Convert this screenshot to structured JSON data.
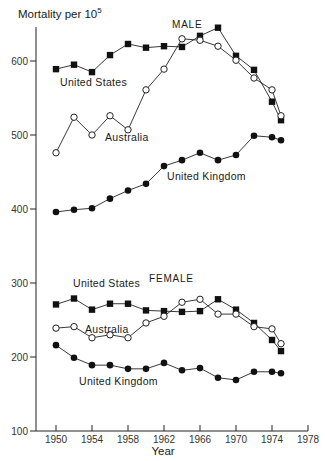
{
  "chart_data": {
    "type": "line",
    "title": "",
    "ylabel": "Mortality per 10^5",
    "ylabel_base": "Mortality per 10",
    "ylabel_exp": "5",
    "xlabel": "Year",
    "xlim": [
      1948,
      1978
    ],
    "ylim": [
      100,
      650
    ],
    "x_ticks": [
      1950,
      1954,
      1958,
      1962,
      1966,
      1970,
      1974,
      1978
    ],
    "y_ticks": [
      100,
      200,
      300,
      400,
      500,
      600
    ],
    "grid": false,
    "legend": "inline labels",
    "panels": [
      {
        "name": "MALE",
        "series": [
          {
            "name": "United States",
            "marker": "filled-square",
            "x": [
              1950,
              1952,
              1954,
              1956,
              1958,
              1960,
              1962,
              1964,
              1966,
              1968,
              1970,
              1972,
              1974,
              1975
            ],
            "values": [
              589,
              595,
              585,
              608,
              623,
              618,
              620,
              619,
              634,
              645,
              607,
              588,
              545,
              520
            ]
          },
          {
            "name": "Australia",
            "marker": "open-circle",
            "x": [
              1950,
              1952,
              1954,
              1956,
              1958,
              1960,
              1962,
              1964,
              1966,
              1968,
              1970,
              1972,
              1974,
              1975
            ],
            "values": [
              476,
              524,
              500,
              526,
              507,
              561,
              589,
              630,
              628,
              620,
              601,
              577,
              561,
              526
            ]
          },
          {
            "name": "United Kingdom",
            "marker": "filled-circle",
            "x": [
              1950,
              1952,
              1954,
              1956,
              1958,
              1960,
              1962,
              1964,
              1966,
              1968,
              1970,
              1972,
              1974,
              1975
            ],
            "values": [
              396,
              399,
              401,
              414,
              425,
              434,
              458,
              466,
              476,
              466,
              473,
              499,
              497,
              493
            ]
          }
        ]
      },
      {
        "name": "FEMALE",
        "series": [
          {
            "name": "United States",
            "marker": "filled-square",
            "x": [
              1950,
              1952,
              1954,
              1956,
              1958,
              1960,
              1962,
              1964,
              1966,
              1968,
              1970,
              1972,
              1974,
              1975
            ],
            "values": [
              271,
              279,
              264,
              272,
              272,
              263,
              262,
              261,
              262,
              278,
              264,
              246,
              223,
              208
            ]
          },
          {
            "name": "Australia",
            "marker": "open-circle",
            "x": [
              1950,
              1952,
              1954,
              1956,
              1958,
              1960,
              1962,
              1964,
              1966,
              1968,
              1970,
              1972,
              1974,
              1975
            ],
            "values": [
              239,
              241,
              226,
              230,
              226,
              246,
              255,
              274,
              278,
              258,
              258,
              241,
              238,
              218
            ]
          },
          {
            "name": "United Kingdom",
            "marker": "filled-circle",
            "x": [
              1950,
              1952,
              1954,
              1956,
              1958,
              1960,
              1962,
              1964,
              1966,
              1968,
              1970,
              1972,
              1974,
              1975
            ],
            "values": [
              216,
              199,
              189,
              189,
              184,
              184,
              192,
              182,
              185,
              172,
              169,
              180,
              180,
              178
            ]
          }
        ]
      }
    ],
    "annotations": [
      {
        "text": "MALE",
        "near": [
          1966,
          640
        ]
      },
      {
        "text": "United States",
        "near": [
          1957,
          585
        ]
      },
      {
        "text": "Australia",
        "near": [
          1960,
          500
        ]
      },
      {
        "text": "United Kingdom",
        "near": [
          1967,
          455
        ]
      },
      {
        "text": "United States",
        "near": [
          1956,
          292
        ]
      },
      {
        "text": "FEMALE",
        "near": [
          1966,
          295
        ]
      },
      {
        "text": "Australia",
        "near": [
          1957,
          246
        ]
      },
      {
        "text": "United Kingdom",
        "near": [
          1957,
          168
        ]
      }
    ]
  },
  "labels": {
    "male": "MALE",
    "female": "FEMALE",
    "male_us": "United States",
    "male_au": "Australia",
    "male_uk": "United Kingdom",
    "female_us": "United States",
    "female_au": "Australia",
    "female_uk": "United Kingdom"
  },
  "colors": {
    "ink": "#1a1a1a",
    "background": "#ffffff"
  }
}
